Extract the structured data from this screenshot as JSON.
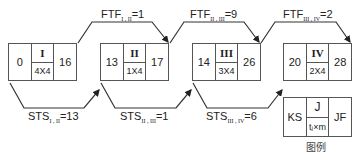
{
  "activities": [
    {
      "id": "I",
      "ks": "0",
      "jf": "16",
      "duration": "4X4"
    },
    {
      "id": "II",
      "ks": "13",
      "jf": "17",
      "duration": "1X4"
    },
    {
      "id": "III",
      "ks": "14",
      "jf": "26",
      "duration": "3X4"
    },
    {
      "id": "IV",
      "ks": "20",
      "jf": "28",
      "duration": "2X4"
    }
  ],
  "ftf_links": [
    {
      "prefix": "FTF",
      "sub": "I , II",
      "value": "=1"
    },
    {
      "prefix": "FTF",
      "sub": "II , III",
      "value": "=9"
    },
    {
      "prefix": "FTF",
      "sub": "III , IV",
      "value": "=2"
    }
  ],
  "sts_links": [
    {
      "prefix": "STS",
      "sub": "I , II",
      "value": "=13"
    },
    {
      "prefix": "STS",
      "sub": "II , III",
      "value": "=1"
    },
    {
      "prefix": "STS",
      "sub": "III , IV",
      "value": "=6"
    }
  ],
  "legend": {
    "ks": "KS",
    "j": "J",
    "t": "tⱼ×m",
    "jf": "JF",
    "caption": "图例"
  },
  "colors": {
    "line": "#333333",
    "border": "#555555"
  }
}
